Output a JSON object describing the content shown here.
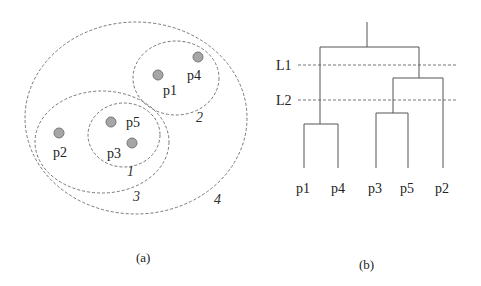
{
  "panel_a": {
    "caption": "(a)",
    "points": [
      {
        "id": "p1",
        "label": "p1",
        "cx": 158,
        "cy": 75,
        "lx": 163,
        "ly": 95
      },
      {
        "id": "p4",
        "label": "p4",
        "cx": 198,
        "cy": 57,
        "lx": 187,
        "ly": 80
      },
      {
        "id": "p5",
        "label": "p5",
        "cx": 111,
        "cy": 122,
        "lx": 126,
        "ly": 127
      },
      {
        "id": "p3",
        "label": "p3",
        "cx": 132,
        "cy": 143,
        "lx": 107,
        "ly": 158
      },
      {
        "id": "p2",
        "label": "p2",
        "cx": 59,
        "cy": 133,
        "lx": 53,
        "ly": 157
      }
    ],
    "clusters": [
      {
        "id": "1",
        "label": "1",
        "cx": 124,
        "cy": 135,
        "rx": 36,
        "ry": 32,
        "lx": 127,
        "ly": 176
      },
      {
        "id": "2",
        "label": "2",
        "cx": 176,
        "cy": 78,
        "rx": 43,
        "ry": 37,
        "lx": 196,
        "ly": 122
      },
      {
        "id": "3",
        "label": "3",
        "cx": 102,
        "cy": 142,
        "rx": 67,
        "ry": 51,
        "lx": 133,
        "ly": 201
      },
      {
        "id": "4",
        "label": "4",
        "cx": 136,
        "cy": 118,
        "rx": 111,
        "ry": 96,
        "lx": 214,
        "ly": 204
      }
    ]
  },
  "panel_b": {
    "caption": "(b)",
    "cut_lines": [
      {
        "label": "L1",
        "y": 65
      },
      {
        "label": "L2",
        "y": 100
      }
    ],
    "leaves": [
      {
        "label": "p1",
        "x": 304
      },
      {
        "label": "p4",
        "x": 338
      },
      {
        "label": "p3",
        "x": 376
      },
      {
        "label": "p5",
        "x": 408
      },
      {
        "label": "p2",
        "x": 443
      }
    ],
    "merges": [
      {
        "children": [
          "p1",
          "p4"
        ],
        "height_y": 124
      },
      {
        "children": [
          "p3",
          "p5"
        ],
        "height_y": 113
      },
      {
        "children": [
          "p3,p5",
          "p2"
        ],
        "height_y": 78
      },
      {
        "children": [
          "p1,p4",
          "p3,p5,p2"
        ],
        "height_y": 47
      }
    ]
  }
}
